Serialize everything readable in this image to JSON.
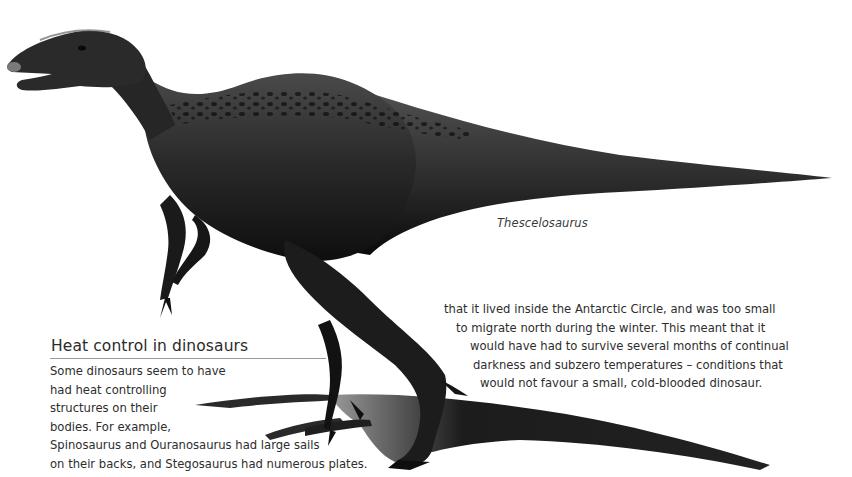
{
  "figure": {
    "caption": "Thescelosaurus"
  },
  "sidebar": {
    "title": "Heat control in dinosaurs",
    "lines": [
      "Some dinosaurs seem to have",
      "had heat controlling",
      "structures on their",
      "bodies. For example,",
      "Spinosaurus and Ouranosaurus had large sails",
      "on their backs, and Stegosaurus had numerous plates."
    ]
  },
  "body": {
    "lines": [
      "that it lived inside the Antarctic Circle, and was too small",
      "to migrate north during the winter. This meant that it",
      "would have had to survive several months of continual",
      "darkness and subzero temperatures – conditions that",
      "would not favour a small, cold-blooded dinosaur."
    ]
  },
  "colors": {
    "background": "#ffffff",
    "text": "#2d2d2d",
    "rule": "#9a9a9a",
    "dinosaur_dark": "#141414",
    "dinosaur_mid": "#3a3a3a",
    "shadow": "#1e1e1e"
  }
}
